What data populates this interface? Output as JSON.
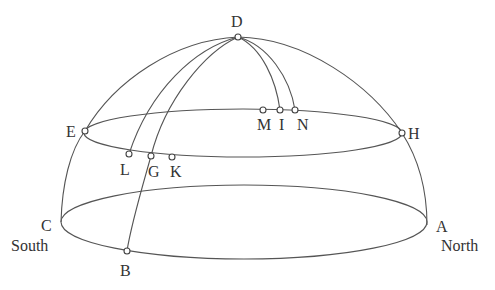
{
  "diagram": {
    "type": "celestial-hemisphere",
    "stroke_color": "#555555",
    "background": "#ffffff",
    "labels": {
      "D": "D",
      "E": "E",
      "H": "H",
      "M": "M",
      "I": "I",
      "N": "N",
      "L": "L",
      "G": "G",
      "K": "K",
      "C": "C",
      "A": "A",
      "B": "B",
      "south": "South",
      "north": "North"
    }
  }
}
